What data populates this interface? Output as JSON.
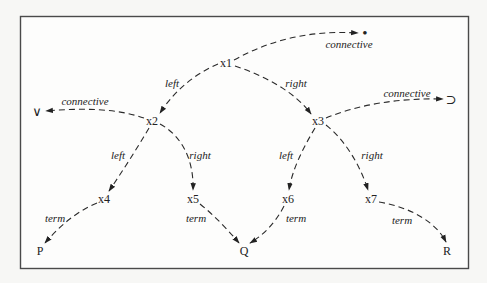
{
  "diagram": {
    "type": "tree",
    "nodes": [
      {
        "id": "x1",
        "label": "x1",
        "x": 226,
        "y": 63
      },
      {
        "id": "x2",
        "label": "x2",
        "x": 152,
        "y": 121
      },
      {
        "id": "x3",
        "label": "x3",
        "x": 318,
        "y": 121
      },
      {
        "id": "x4",
        "label": "x4",
        "x": 104,
        "y": 199
      },
      {
        "id": "x5",
        "label": "x5",
        "x": 193,
        "y": 199
      },
      {
        "id": "x6",
        "label": "x6",
        "x": 288,
        "y": 199
      },
      {
        "id": "x7",
        "label": "x7",
        "x": 371,
        "y": 199
      }
    ],
    "terminals": [
      {
        "id": "P",
        "label": "P",
        "x": 40,
        "y": 251
      },
      {
        "id": "Q",
        "label": "Q",
        "x": 244,
        "y": 251
      },
      {
        "id": "R",
        "label": "R",
        "x": 447,
        "y": 251
      }
    ],
    "symbols": [
      {
        "id": "or",
        "label": "∨",
        "name": "disjunction-symbol",
        "x": 37,
        "y": 111
      },
      {
        "id": "and",
        "label": "•",
        "name": "conjunction-dot-symbol",
        "x": 365,
        "y": 33
      },
      {
        "id": "implies",
        "label": "⊃",
        "name": "implication-symbol",
        "x": 451,
        "y": 99
      }
    ],
    "edge_labels": [
      {
        "text": "connective",
        "x": 349,
        "y": 44,
        "edge": "x1-connective"
      },
      {
        "text": "left",
        "x": 172,
        "y": 83,
        "edge": "x1-left"
      },
      {
        "text": "right",
        "x": 296,
        "y": 83,
        "edge": "x1-right"
      },
      {
        "text": "connective",
        "x": 85,
        "y": 101,
        "edge": "x2-connective"
      },
      {
        "text": "connective",
        "x": 407,
        "y": 93,
        "edge": "x3-connective"
      },
      {
        "text": "left",
        "x": 118,
        "y": 155,
        "edge": "x2-left"
      },
      {
        "text": "right",
        "x": 200,
        "y": 155,
        "edge": "x2-right"
      },
      {
        "text": "left",
        "x": 286,
        "y": 155,
        "edge": "x3-left"
      },
      {
        "text": "right",
        "x": 372,
        "y": 155,
        "edge": "x3-right"
      },
      {
        "text": "term",
        "x": 55,
        "y": 218,
        "edge": "x4-term"
      },
      {
        "text": "term",
        "x": 196,
        "y": 218,
        "edge": "x5-term"
      },
      {
        "text": "term",
        "x": 296,
        "y": 218,
        "edge": "x6-term"
      },
      {
        "text": "term",
        "x": 402,
        "y": 220,
        "edge": "x7-term"
      }
    ],
    "edges": [
      {
        "from": "x1",
        "to": "and",
        "label": "connective"
      },
      {
        "from": "x1",
        "to": "x2",
        "label": "left"
      },
      {
        "from": "x1",
        "to": "x3",
        "label": "right"
      },
      {
        "from": "x2",
        "to": "or",
        "label": "connective"
      },
      {
        "from": "x2",
        "to": "x4",
        "label": "left"
      },
      {
        "from": "x2",
        "to": "x5",
        "label": "right"
      },
      {
        "from": "x3",
        "to": "implies",
        "label": "connective"
      },
      {
        "from": "x3",
        "to": "x6",
        "label": "left"
      },
      {
        "from": "x3",
        "to": "x7",
        "label": "right"
      },
      {
        "from": "x4",
        "to": "P",
        "label": "term"
      },
      {
        "from": "x5",
        "to": "Q",
        "label": "term"
      },
      {
        "from": "x6",
        "to": "Q",
        "label": "term"
      },
      {
        "from": "x7",
        "to": "R",
        "label": "term"
      }
    ]
  },
  "colors": {
    "background": "#f7f7f5",
    "frame_fill": "#fdfdfc",
    "frame_stroke": "#4a4a4a",
    "ink": "#222222"
  }
}
